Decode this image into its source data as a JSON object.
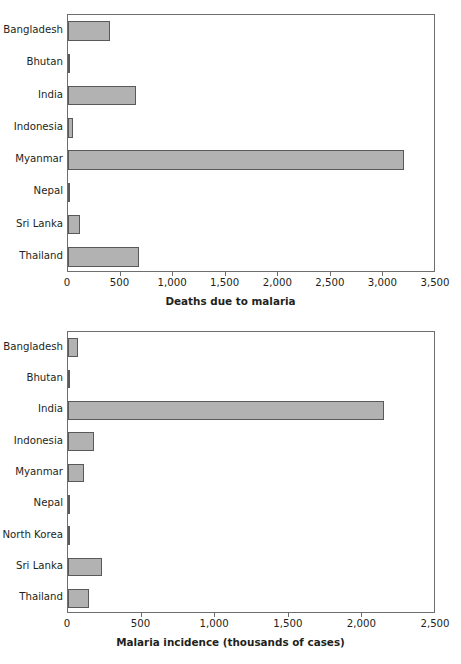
{
  "chart_data": [
    {
      "type": "bar",
      "orientation": "horizontal",
      "id": "deaths-due-to-malaria",
      "title": "",
      "xlabel": "Deaths due to malaria",
      "ylabel": "",
      "xlim": [
        0,
        3500
      ],
      "xticks": [
        0,
        500,
        1000,
        1500,
        2000,
        2500,
        3000,
        3500
      ],
      "xticklabels": [
        "0",
        "500",
        "1,000",
        "1,500",
        "2,000",
        "2,500",
        "3,000",
        "3,500"
      ],
      "grid": false,
      "legend": false,
      "bar_color": "#b2b2b2",
      "bar_edge_color": "#58595b",
      "categories": [
        "Bangladesh",
        "Bhutan",
        "India",
        "Indonesia",
        "Myanmar",
        "Nepal",
        "Sri Lanka",
        "Thailand"
      ],
      "values": [
        400,
        15,
        650,
        50,
        3200,
        10,
        110,
        680
      ]
    },
    {
      "type": "bar",
      "orientation": "horizontal",
      "id": "malaria-incidence",
      "title": "",
      "xlabel": "Malaria incidence (thousands of cases)",
      "ylabel": "",
      "xlim": [
        0,
        2500
      ],
      "xticks": [
        0,
        500,
        1000,
        1500,
        2000,
        2500
      ],
      "xticklabels": [
        "0",
        "500",
        "1,000",
        "1,500",
        "2,000",
        "2,500"
      ],
      "grid": false,
      "legend": false,
      "bar_color": "#b2b2b2",
      "bar_edge_color": "#58595b",
      "categories": [
        "Bangladesh",
        "Bhutan",
        "India",
        "Indonesia",
        "Myanmar",
        "Nepal",
        "North Korea",
        "Sri Lanka",
        "Thailand"
      ],
      "values": [
        65,
        8,
        2150,
        175,
        110,
        10,
        3,
        230,
        140
      ]
    }
  ]
}
